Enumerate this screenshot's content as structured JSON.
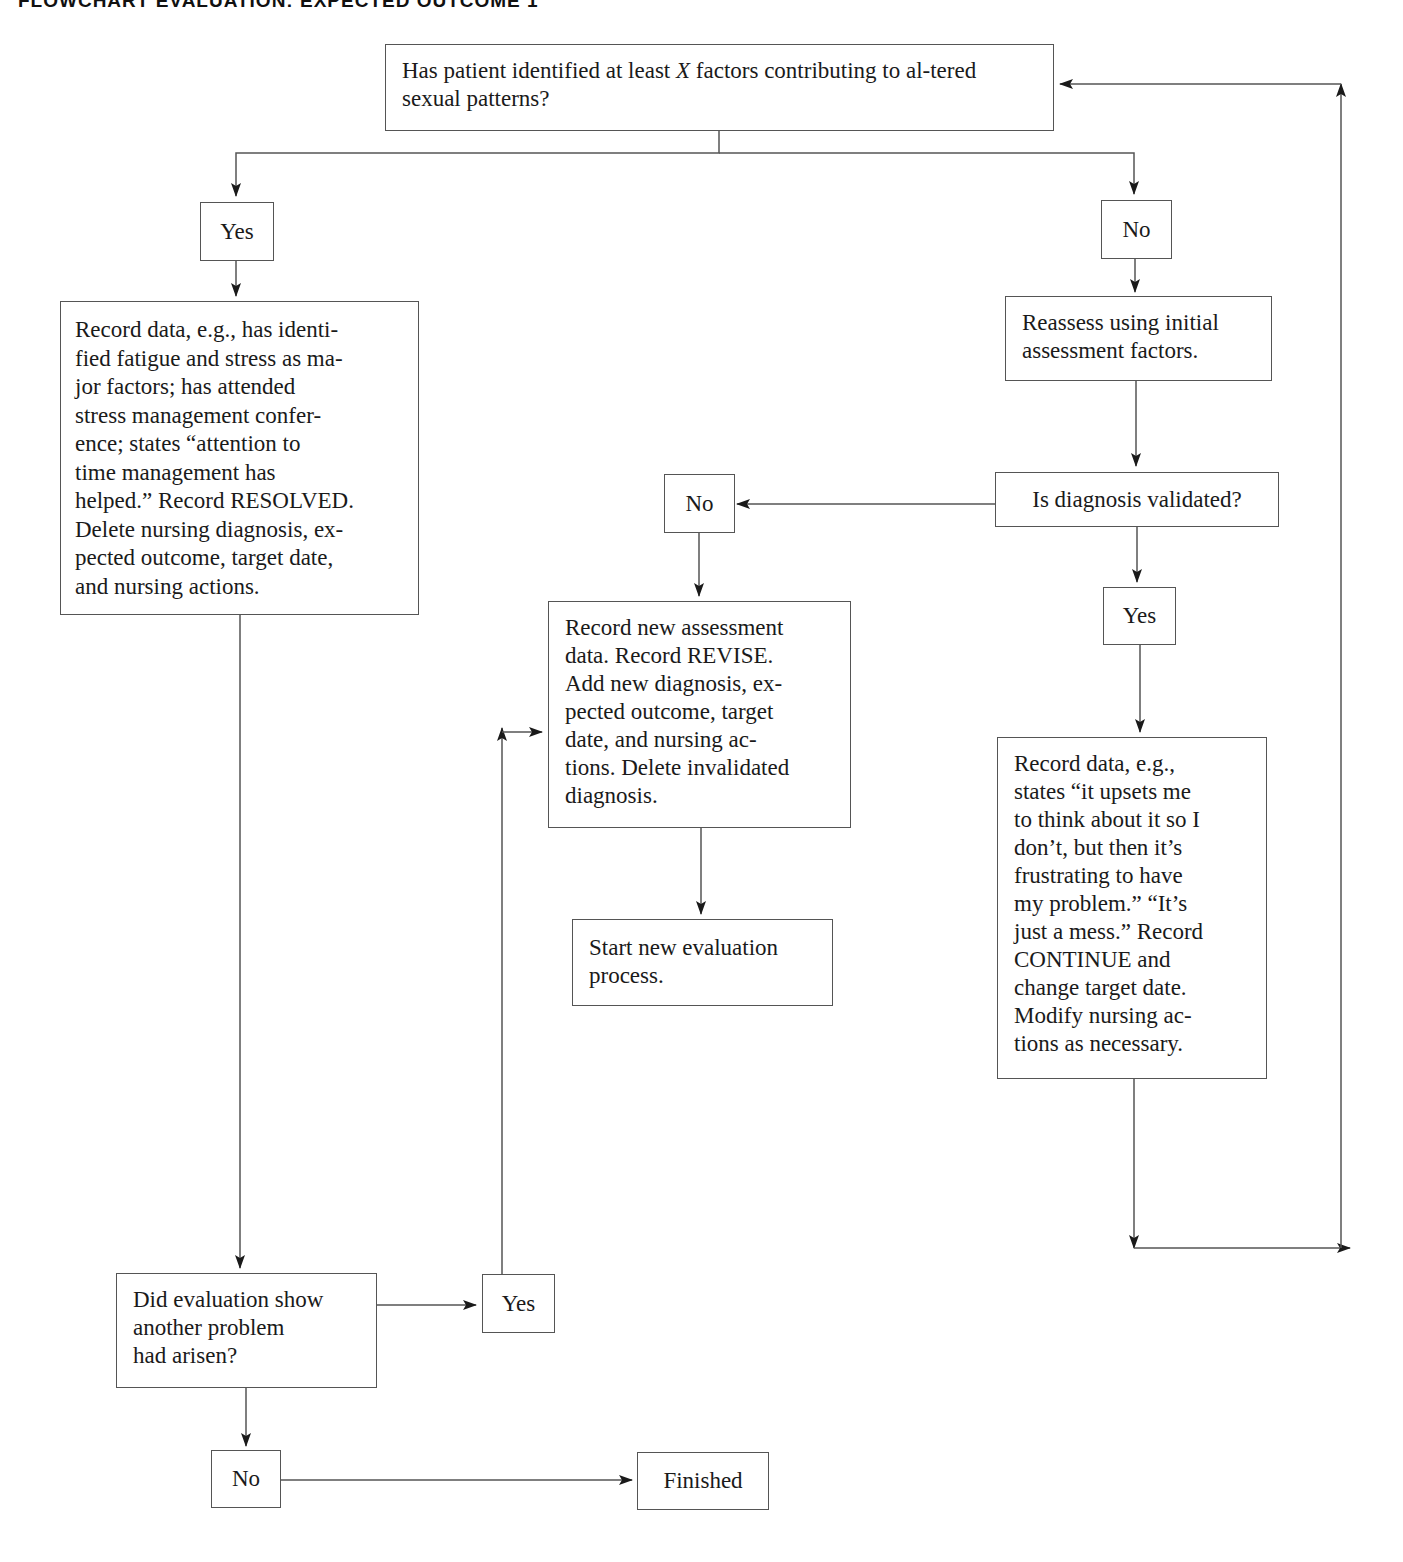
{
  "header": {
    "title": "FLOWCHART EVALUATION: EXPECTED OUTCOME 1"
  },
  "nodes": {
    "q_factors": {
      "text_before": "Has patient identified at least ",
      "text_italic": "X",
      "text_after": " factors contributing to al-tered sexual patterns?"
    },
    "yes_1": {
      "text": "Yes"
    },
    "no_1": {
      "text": "No"
    },
    "resolved": {
      "text": "Record data, e.g., has identi-fied fatigue and stress as ma-jor factors; has attended stress management confer-ence; states “attention to time management has helped.” Record RESOLVED. Delete nursing diagnosis, ex-pected outcome, target date, and nursing actions."
    },
    "reassess": {
      "text": "Reassess using initial assessment factors."
    },
    "q_validated": {
      "text": "Is diagnosis validated?"
    },
    "no_2": {
      "text": "No"
    },
    "revise": {
      "text": "Record new assessment data. Record REVISE. Add new diagnosis, ex-pected outcome, target date, and nursing ac-tions. Delete invalidated diagnosis."
    },
    "start_new": {
      "text": "Start new evaluation process."
    },
    "yes_2": {
      "text": "Yes"
    },
    "continue": {
      "text": "Record data, e.g., states “it upsets me to think about it so I don’t, but then it’s frustrating to have my problem.” “It’s just a mess.” Record CONTINUE and change target date. Modify nursing ac-tions as necessary."
    },
    "q_another": {
      "text": "Did evaluation show another problem had arisen?"
    },
    "yes_3": {
      "text": "Yes"
    },
    "no_3": {
      "text": "No"
    },
    "finished": {
      "text": "Finished"
    }
  },
  "lines": {
    "q_factors": [
      "Has patient identified at least X factors contributing to al-",
      "tered sexual patterns?"
    ],
    "resolved": [
      "Record data, e.g., has identi-",
      "fied fatigue and stress as ma-",
      "jor factors; has attended",
      "stress management confer-",
      "ence; states “attention to",
      "time management has",
      "helped.” Record RESOLVED.",
      "Delete nursing diagnosis, ex-",
      "pected outcome, target date,",
      "and nursing actions."
    ],
    "reassess": [
      "Reassess using initial",
      "assessment factors."
    ],
    "revise": [
      "Record new assessment",
      "data. Record REVISE.",
      "Add new diagnosis, ex-",
      "pected outcome, target",
      "date, and nursing ac-",
      "tions. Delete invalidated",
      "diagnosis."
    ],
    "start_new": [
      "Start new evaluation",
      "process."
    ],
    "continue": [
      "Record data, e.g.,",
      "states “it upsets me",
      "to think about it so I",
      "don’t, but then it’s",
      "frustrating to have",
      "my problem.” “It’s",
      "just a mess.” Record",
      "CONTINUE and",
      "change target date.",
      "Modify nursing ac-",
      "tions as necessary."
    ],
    "q_another": [
      "Did evaluation show",
      "another problem",
      "had arisen?"
    ]
  },
  "colors": {
    "line": "#555555",
    "arrow": "#1a1a1a",
    "text": "#1a1a1a",
    "background": "#ffffff"
  }
}
